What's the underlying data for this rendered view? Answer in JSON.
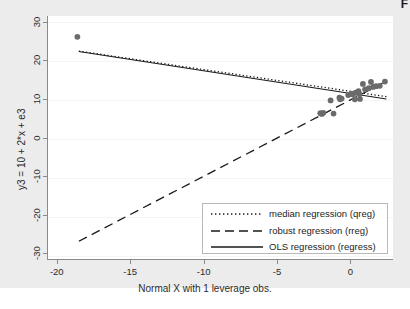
{
  "figure": {
    "corner_mark": "F",
    "background_color": "#ececec",
    "panel_color": "#ffffff"
  },
  "chart_data": {
    "type": "scatter",
    "title": "",
    "subtitle": "",
    "xlabel": "Normal X with 1 leverage obs.",
    "ylabel": "y3 = 10 + 2*x + e3",
    "xlim": [
      -20.6,
      2.9
    ],
    "ylim": [
      -31.5,
      31.5
    ],
    "xticks": [
      -20,
      -15,
      -10,
      -5,
      0
    ],
    "xticklabels": [
      "-20",
      "-15",
      "-10",
      "-5",
      "0"
    ],
    "yticks": [
      30,
      20,
      10,
      0,
      -10,
      -20,
      -30
    ],
    "yticklabels": [
      "30",
      "20",
      "10",
      "0",
      "-10",
      "-20",
      "-30"
    ],
    "grid": true,
    "grid_axis": "y",
    "legend_position": "lower right",
    "marker_color": "#6b6b6b",
    "marker_size": 4.2,
    "points": [
      {
        "x": -18.6,
        "y": 26.1
      },
      {
        "x": -2.05,
        "y": 6.3
      },
      {
        "x": -1.95,
        "y": 6.1
      },
      {
        "x": -1.85,
        "y": 6.4
      },
      {
        "x": -1.35,
        "y": 9.6
      },
      {
        "x": -1.15,
        "y": 6.2
      },
      {
        "x": -0.75,
        "y": 10.3
      },
      {
        "x": -0.7,
        "y": 9.9
      },
      {
        "x": -0.6,
        "y": 10.1
      },
      {
        "x": -0.15,
        "y": 11.0
      },
      {
        "x": 0.05,
        "y": 11.4
      },
      {
        "x": 0.15,
        "y": 11.2
      },
      {
        "x": 0.3,
        "y": 9.9
      },
      {
        "x": 0.35,
        "y": 11.6
      },
      {
        "x": 0.55,
        "y": 12.0
      },
      {
        "x": 0.6,
        "y": 11.3
      },
      {
        "x": 0.65,
        "y": 10.0
      },
      {
        "x": 0.85,
        "y": 13.9
      },
      {
        "x": 1.0,
        "y": 12.5
      },
      {
        "x": 1.25,
        "y": 12.8
      },
      {
        "x": 1.4,
        "y": 14.4
      },
      {
        "x": 1.55,
        "y": 13.1
      },
      {
        "x": 1.75,
        "y": 13.3
      },
      {
        "x": 2.0,
        "y": 13.4
      },
      {
        "x": 2.35,
        "y": 14.5
      }
    ],
    "series": [
      {
        "name": "median regression (qreg)",
        "style": "dotted",
        "color": "#1a1a1a",
        "x": [
          -18.5,
          2.45
        ],
        "y": [
          22.4,
          10.6
        ]
      },
      {
        "name": "robust regression (rreg)",
        "style": "dashed",
        "color": "#1a1a1a",
        "x": [
          -18.5,
          2.45
        ],
        "y": [
          -26.9,
          14.6
        ]
      },
      {
        "name": "OLS regression (regress)",
        "style": "solid",
        "color": "#1a1a1a",
        "x": [
          -18.5,
          2.45
        ],
        "y": [
          22.3,
          10.0
        ]
      }
    ]
  },
  "legend": {
    "entries": [
      {
        "label": "median regression (qreg)",
        "key": "dotted-line-key"
      },
      {
        "label": "robust regression (rreg)",
        "key": "dashed-line-key"
      },
      {
        "label": "OLS regression (regress)",
        "key": "solid-line-key"
      }
    ]
  }
}
